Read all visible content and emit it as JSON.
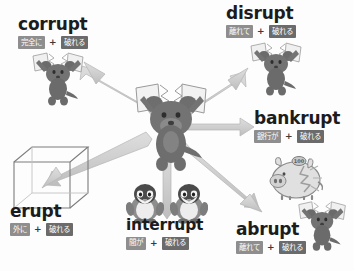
{
  "diagram": {
    "title_concept": "rupt",
    "root_meaning_chip": "破れる",
    "plus_symbol": "+",
    "colors": {
      "background": "#fdfdfd",
      "chip_light": "#8e8e8e",
      "chip_dark": "#6b6b6b",
      "word_text": "#1c1c1c",
      "arrow": "#c9c9c9",
      "arrow_stroke": "#b0b0b0",
      "figure_dark": "#6e6e6e",
      "figure_mid": "#8f8f8f",
      "figure_light": "#d8d8d8",
      "outline": "#7a7a7a"
    },
    "nodes": [
      {
        "id": "corrupt",
        "word": "corrupt",
        "prefix_chip": "完全に",
        "root_chip": "破れる",
        "illustration": "bear-tearing-paper"
      },
      {
        "id": "disrupt",
        "word": "disrupt",
        "prefix_chip": "離れて",
        "root_chip": "破れる",
        "illustration": "bear-tearing-paper"
      },
      {
        "id": "bankrupt",
        "word": "bankrupt",
        "prefix_chip": "銀行が",
        "root_chip": "破れる",
        "illustration": "cracked-piggy-bank"
      },
      {
        "id": "abrupt",
        "word": "abrupt",
        "prefix_chip": "離れて",
        "root_chip": "破れる",
        "illustration": "bear-tearing-paper"
      },
      {
        "id": "interrupt",
        "word": "interrupt",
        "prefix_chip": "間が",
        "root_chip": "破れる",
        "illustration": "two-penguins"
      },
      {
        "id": "erupt",
        "word": "erupt",
        "prefix_chip": "外に",
        "root_chip": "破れる",
        "illustration": "wireframe-cube"
      }
    ],
    "center": {
      "illustration": "bear-tearing-paper-center",
      "arrow_count": 6,
      "arrow_targets": [
        "corrupt",
        "disrupt",
        "bankrupt",
        "abrupt",
        "interrupt",
        "erupt"
      ]
    },
    "piggy_bank_coin_label": "100"
  }
}
